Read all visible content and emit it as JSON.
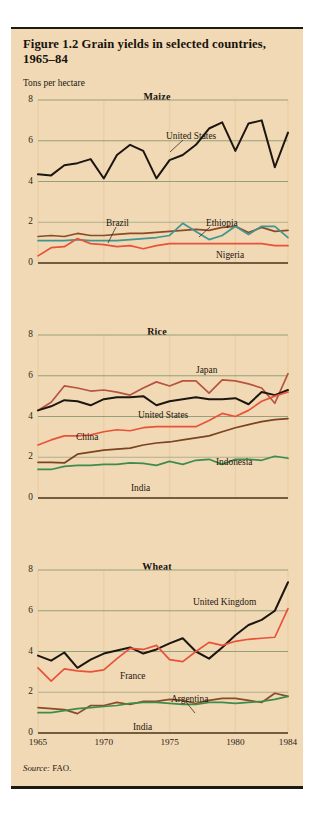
{
  "figure": {
    "title": "Figure 1.2  Grain yields in selected countries, 1965–84",
    "y_axis_caption": "Tons per hectare",
    "source_prefix": "Source:",
    "source_value": " FAO.",
    "background_color": "#f2d9b5",
    "frame_color": "#1d1a14"
  },
  "axis": {
    "yticks": [
      "8",
      "6",
      "4",
      "2",
      "0"
    ],
    "ytick_values": [
      8,
      6,
      4,
      2,
      0
    ],
    "xticks": [
      "1965",
      "1970",
      "1975",
      "1980",
      "1984"
    ],
    "xtick_values": [
      1965,
      1970,
      1975,
      1980,
      1984
    ]
  },
  "colors": {
    "black": "#1c1610",
    "brown": "#8a4b28",
    "dark_brown": "#7b4322",
    "red": "#e8523a",
    "brick": "#b55440",
    "teal": "#3f968f",
    "green": "#3c8c4e",
    "gridline": "#8a9a72",
    "gridline_faint": "#a8a98a",
    "axis": "#4a3318",
    "vgrid": "#ead0a6"
  },
  "panels": [
    {
      "id": "maize",
      "title": "Maize",
      "labels": [
        {
          "name": "United States",
          "x": 128,
          "y": 31
        },
        {
          "name": "Brazil",
          "x": 68,
          "y": 118
        },
        {
          "name": "Ethiopia",
          "x": 168,
          "y": 118
        },
        {
          "name": "Nigeria",
          "x": 178,
          "y": 150
        }
      ],
      "leaders": [
        {
          "from_x": 145,
          "from_y": 40,
          "to_x": 132,
          "to_y": 52
        },
        {
          "from_x": 78,
          "from_y": 127,
          "to_x": 70,
          "to_y": 143
        },
        {
          "from_x": 172,
          "from_y": 127,
          "to_x": 161,
          "to_y": 137
        }
      ]
    },
    {
      "id": "rice",
      "title": "Rice",
      "labels": [
        {
          "name": "Japan",
          "x": 158,
          "y": 30
        },
        {
          "name": "United States",
          "x": 100,
          "y": 75
        },
        {
          "name": "China",
          "x": 38,
          "y": 97
        },
        {
          "name": "Indonesia",
          "x": 178,
          "y": 122
        },
        {
          "name": "India",
          "x": 93,
          "y": 148
        }
      ],
      "leaders": []
    },
    {
      "id": "wheat",
      "title": "Wheat",
      "labels": [
        {
          "name": "United Kingdom",
          "x": 155,
          "y": 27
        },
        {
          "name": "France",
          "x": 82,
          "y": 101
        },
        {
          "name": "Argentina",
          "x": 133,
          "y": 124
        },
        {
          "name": "India",
          "x": 95,
          "y": 152
        }
      ],
      "leaders": [
        {
          "from_x": 148,
          "from_y": 132,
          "to_x": 157,
          "to_y": 143
        }
      ]
    }
  ],
  "chart_data": {
    "type": "line",
    "title": "Figure 1.2  Grain yields in selected countries, 1965–84",
    "xlabel": "",
    "ylabel": "Tons per hectare",
    "xlim": [
      1965,
      1984
    ],
    "ylim": [
      0,
      8
    ],
    "grid": true,
    "legend": "inline-labels",
    "source": "Source: FAO.",
    "x": [
      1965,
      1966,
      1967,
      1968,
      1969,
      1970,
      1971,
      1972,
      1973,
      1974,
      1975,
      1976,
      1977,
      1978,
      1979,
      1980,
      1981,
      1982,
      1983,
      1984
    ],
    "subplots": [
      {
        "title": "Maize",
        "ylim": [
          0,
          8
        ],
        "yticks": [
          0,
          2,
          4,
          6,
          8
        ],
        "series": [
          {
            "name": "United States",
            "color": "#1c1610",
            "values": [
              4.35,
              4.3,
              4.8,
              4.9,
              5.1,
              4.15,
              5.3,
              5.8,
              5.5,
              4.15,
              5.05,
              5.3,
              5.8,
              6.6,
              6.9,
              5.5,
              6.85,
              7.0,
              4.7,
              6.4
            ]
          },
          {
            "name": "Brazil",
            "color": "#8a4b28",
            "values": [
              1.3,
              1.35,
              1.3,
              1.45,
              1.35,
              1.35,
              1.4,
              1.45,
              1.45,
              1.5,
              1.55,
              1.6,
              1.65,
              1.6,
              1.75,
              1.8,
              1.5,
              1.75,
              1.55,
              1.6
            ]
          },
          {
            "name": "Ethiopia",
            "color": "#3f968f",
            "values": [
              1.1,
              1.1,
              1.1,
              1.15,
              1.1,
              1.1,
              1.1,
              1.15,
              1.2,
              1.25,
              1.35,
              1.95,
              1.55,
              1.15,
              1.35,
              1.8,
              1.4,
              1.8,
              1.8,
              1.25
            ]
          },
          {
            "name": "Nigeria",
            "color": "#e8523a",
            "values": [
              0.35,
              0.75,
              0.8,
              1.2,
              0.95,
              0.9,
              0.8,
              0.85,
              0.7,
              0.85,
              0.95,
              0.95,
              0.95,
              0.95,
              0.95,
              0.95,
              0.95,
              0.95,
              0.85,
              0.85
            ]
          }
        ]
      },
      {
        "title": "Rice",
        "ylim": [
          0,
          8
        ],
        "yticks": [
          0,
          2,
          4,
          6,
          8
        ],
        "series": [
          {
            "name": "Japan",
            "color": "#b55440",
            "values": [
              4.3,
              4.7,
              5.5,
              5.4,
              5.25,
              5.3,
              5.2,
              5.05,
              5.4,
              5.7,
              5.5,
              5.75,
              5.75,
              5.15,
              5.8,
              5.75,
              5.6,
              5.4,
              4.65,
              6.1
            ]
          },
          {
            "name": "United States",
            "color": "#1c1610",
            "values": [
              4.3,
              4.5,
              4.8,
              4.75,
              4.55,
              4.85,
              4.95,
              4.95,
              5.0,
              4.55,
              4.75,
              4.85,
              4.95,
              4.85,
              4.85,
              4.9,
              4.6,
              5.2,
              5.05,
              5.3
            ]
          },
          {
            "name": "China",
            "color": "#e8523a",
            "values": [
              2.6,
              2.85,
              3.05,
              3.05,
              3.1,
              3.25,
              3.35,
              3.3,
              3.45,
              3.5,
              3.5,
              3.5,
              3.5,
              3.8,
              4.15,
              4.0,
              4.3,
              4.75,
              5.0,
              5.2
            ]
          },
          {
            "name": "Indonesia",
            "color": "#7b4322",
            "values": [
              1.75,
              1.75,
              1.72,
              2.15,
              2.25,
              2.35,
              2.4,
              2.45,
              2.6,
              2.7,
              2.75,
              2.85,
              2.95,
              3.05,
              3.25,
              3.45,
              3.6,
              3.75,
              3.85,
              3.9
            ]
          },
          {
            "name": "India",
            "color": "#3c8c4e",
            "values": [
              1.4,
              1.4,
              1.55,
              1.6,
              1.6,
              1.65,
              1.65,
              1.72,
              1.7,
              1.6,
              1.8,
              1.65,
              1.85,
              1.9,
              1.65,
              1.9,
              1.9,
              1.85,
              2.05,
              1.95
            ]
          }
        ]
      },
      {
        "title": "Wheat",
        "ylim": [
          0,
          8
        ],
        "yticks": [
          0,
          2,
          4,
          6,
          8
        ],
        "series": [
          {
            "name": "United Kingdom",
            "color": "#1c1610",
            "values": [
              3.8,
              3.55,
              3.95,
              3.2,
              3.6,
              3.9,
              4.05,
              4.2,
              3.9,
              4.1,
              4.4,
              4.65,
              4.0,
              3.65,
              4.2,
              4.8,
              5.3,
              5.55,
              6.0,
              7.4
            ]
          },
          {
            "name": "France",
            "color": "#e8523a",
            "values": [
              3.2,
              2.55,
              3.15,
              3.05,
              3.0,
              3.1,
              3.65,
              4.15,
              4.1,
              4.3,
              3.6,
              3.5,
              4.0,
              4.45,
              4.3,
              4.5,
              4.6,
              4.65,
              4.7,
              6.1
            ]
          },
          {
            "name": "Argentina",
            "color": "#8a4b28",
            "values": [
              1.25,
              1.2,
              1.15,
              0.95,
              1.35,
              1.35,
              1.5,
              1.4,
              1.55,
              1.55,
              1.65,
              1.6,
              1.45,
              1.6,
              1.7,
              1.7,
              1.6,
              1.5,
              1.95,
              1.8
            ]
          },
          {
            "name": "India",
            "color": "#3c8c4e",
            "values": [
              1.0,
              1.0,
              1.1,
              1.2,
              1.25,
              1.3,
              1.35,
              1.45,
              1.5,
              1.5,
              1.45,
              1.4,
              1.4,
              1.5,
              1.5,
              1.45,
              1.5,
              1.55,
              1.65,
              1.8
            ]
          }
        ]
      }
    ]
  }
}
